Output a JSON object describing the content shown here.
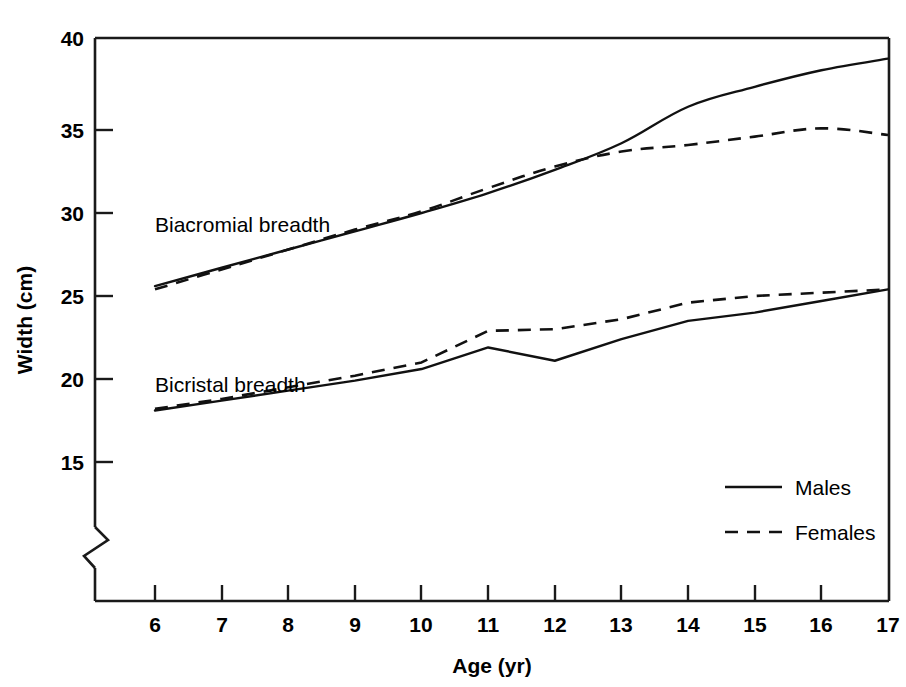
{
  "chart_data": {
    "type": "line",
    "title": "",
    "xlabel": "Age (yr)",
    "ylabel": "Width (cm)",
    "xlim": [
      5.3,
      17.0
    ],
    "ylim": [
      13.2,
      40.0
    ],
    "xticks": [
      6,
      7,
      8,
      9,
      10,
      11,
      12,
      13,
      14,
      15,
      16,
      17
    ],
    "yticks": [
      15,
      20,
      25,
      30,
      35,
      40
    ],
    "xtick_labels": [
      "6",
      "7",
      "8",
      "9",
      "10",
      "11",
      "12",
      "13",
      "14",
      "15",
      "16",
      "17"
    ],
    "ytick_labels": [
      "15",
      "20",
      "25",
      "30",
      "35",
      "40"
    ],
    "grid": false,
    "y_axis_break": true,
    "legend_position": "lower-right",
    "x": [
      6,
      7,
      8,
      9,
      10,
      11,
      12,
      13,
      14,
      15,
      16,
      17
    ],
    "series": [
      {
        "name": "Biacromial breadth - Males",
        "group": "Biacromial breadth",
        "sex": "Males",
        "style": "solid",
        "values": [
          25.6,
          26.7,
          27.8,
          28.9,
          30.0,
          31.2,
          32.6,
          34.2,
          36.4,
          37.6,
          38.6,
          39.3
        ]
      },
      {
        "name": "Biacromial breadth - Females",
        "group": "Biacromial breadth",
        "sex": "Females",
        "style": "dashed",
        "values": [
          25.4,
          26.6,
          27.8,
          29.0,
          30.1,
          31.5,
          32.8,
          33.7,
          34.1,
          34.6,
          35.1,
          34.7
        ]
      },
      {
        "name": "Bicristal breadth - Males",
        "group": "Bicristal breadth",
        "sex": "Males",
        "style": "solid",
        "values": [
          18.1,
          18.7,
          19.3,
          19.9,
          20.6,
          21.9,
          21.1,
          22.4,
          23.5,
          24.0,
          24.7,
          25.4
        ]
      },
      {
        "name": "Bicristal breadth - Females",
        "group": "Bicristal breadth",
        "sex": "Females",
        "style": "dashed",
        "values": [
          18.2,
          18.8,
          19.5,
          20.2,
          21.0,
          22.9,
          23.0,
          23.6,
          24.6,
          25.0,
          25.2,
          25.4
        ]
      }
    ],
    "annotations": [
      {
        "text": "Biacromial breadth",
        "x": 6.0,
        "y": 30.0
      },
      {
        "text": "Bicristal breadth",
        "x": 6.0,
        "y": 21.3
      }
    ],
    "legend": [
      {
        "label": "Males",
        "style": "solid"
      },
      {
        "label": "Females",
        "style": "dashed"
      }
    ]
  },
  "axes": {
    "y_title": "Width (cm)",
    "x_title": "Age (yr)",
    "ytick_40": "40",
    "ytick_35": "35",
    "ytick_30": "30",
    "ytick_25": "25",
    "ytick_20": "20",
    "ytick_15": "15",
    "xtick_6": "6",
    "xtick_7": "7",
    "xtick_8": "8",
    "xtick_9": "9",
    "xtick_10": "10",
    "xtick_11": "11",
    "xtick_12": "12",
    "xtick_13": "13",
    "xtick_14": "14",
    "xtick_15": "15",
    "xtick_16": "16",
    "xtick_17": "17"
  },
  "annotations": {
    "biacromial": "Biacromial breadth",
    "bicristal": "Bicristal breadth"
  },
  "legend": {
    "males": "Males",
    "females": "Females"
  }
}
